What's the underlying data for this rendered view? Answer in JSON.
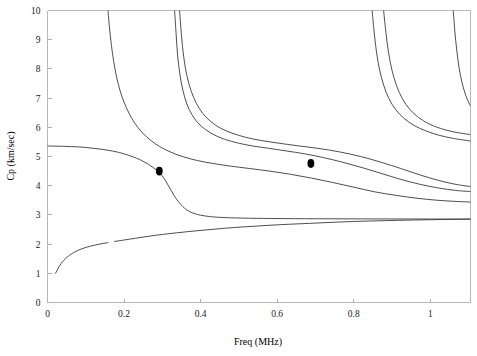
{
  "chart_data": {
    "type": "line",
    "title": "",
    "xlabel": "Freq (MHz)",
    "ylabel": "Cp (km/sec)",
    "xlim": [
      0,
      1.105
    ],
    "ylim": [
      0,
      10
    ],
    "grid": false,
    "legend": "none",
    "xticks": [
      0,
      0.2,
      0.4,
      0.6,
      0.8,
      1
    ],
    "xtick_labels": [
      "0",
      "0.2",
      "0.4",
      "0.6",
      "0.8",
      "1"
    ],
    "yticks": [
      0,
      1,
      2,
      3,
      4,
      5,
      6,
      7,
      8,
      9,
      10
    ],
    "ytick_labels": [
      "0",
      "1",
      "2",
      "3",
      "4",
      "5",
      "6",
      "7",
      "8",
      "9",
      "10"
    ],
    "series": [
      {
        "name": "mode-0-fundamental",
        "points": [
          [
            0.0,
            5.36
          ],
          [
            0.02,
            5.355
          ],
          [
            0.04,
            5.35
          ],
          [
            0.06,
            5.34
          ],
          [
            0.08,
            5.33
          ],
          [
            0.1,
            5.31
          ],
          [
            0.12,
            5.28
          ],
          [
            0.14,
            5.25
          ],
          [
            0.16,
            5.21
          ],
          [
            0.18,
            5.16
          ],
          [
            0.195,
            5.11
          ],
          [
            0.21,
            5.05
          ],
          [
            0.225,
            4.98
          ],
          [
            0.24,
            4.9
          ],
          [
            0.252,
            4.82
          ],
          [
            0.264,
            4.73
          ],
          [
            0.275,
            4.63
          ],
          [
            0.285,
            4.53
          ],
          [
            0.292,
            4.45
          ],
          [
            0.3,
            4.33
          ],
          [
            0.308,
            4.18
          ],
          [
            0.315,
            4.02
          ],
          [
            0.322,
            3.86
          ],
          [
            0.33,
            3.68
          ],
          [
            0.338,
            3.52
          ],
          [
            0.348,
            3.36
          ],
          [
            0.358,
            3.23
          ],
          [
            0.37,
            3.12
          ],
          [
            0.385,
            3.04
          ],
          [
            0.4,
            2.99
          ],
          [
            0.42,
            2.95
          ],
          [
            0.445,
            2.92
          ],
          [
            0.48,
            2.9
          ],
          [
            0.53,
            2.885
          ],
          [
            0.6,
            2.875
          ],
          [
            0.7,
            2.868
          ],
          [
            0.8,
            2.864
          ],
          [
            0.9,
            2.861
          ],
          [
            1.0,
            2.859
          ],
          [
            1.105,
            2.857
          ]
        ]
      },
      {
        "name": "mode-lowest-rising",
        "points": [
          [
            0.021,
            1.0
          ],
          [
            0.025,
            1.1
          ],
          [
            0.03,
            1.22
          ],
          [
            0.036,
            1.34
          ],
          [
            0.043,
            1.45
          ],
          [
            0.052,
            1.56
          ],
          [
            0.062,
            1.66
          ],
          [
            0.074,
            1.75
          ],
          [
            0.088,
            1.83
          ],
          [
            0.104,
            1.9
          ],
          [
            0.122,
            1.96
          ],
          [
            0.14,
            2.01
          ],
          [
            0.158,
            2.05
          ]
        ]
      },
      {
        "name": "mode-lowest-rising-continued",
        "points": [
          [
            0.175,
            2.09
          ],
          [
            0.2,
            2.14
          ],
          [
            0.23,
            2.2
          ],
          [
            0.265,
            2.27
          ],
          [
            0.3,
            2.33
          ],
          [
            0.34,
            2.39
          ],
          [
            0.385,
            2.45
          ],
          [
            0.435,
            2.51
          ],
          [
            0.49,
            2.57
          ],
          [
            0.55,
            2.62
          ],
          [
            0.615,
            2.67
          ],
          [
            0.685,
            2.71
          ],
          [
            0.76,
            2.755
          ],
          [
            0.84,
            2.79
          ],
          [
            0.92,
            2.815
          ],
          [
            1.0,
            2.835
          ],
          [
            1.105,
            2.855
          ]
        ]
      },
      {
        "name": "mode-1",
        "points": [
          [
            0.158,
            10.0
          ],
          [
            0.162,
            9.4
          ],
          [
            0.167,
            8.8
          ],
          [
            0.173,
            8.25
          ],
          [
            0.18,
            7.75
          ],
          [
            0.189,
            7.28
          ],
          [
            0.2,
            6.86
          ],
          [
            0.213,
            6.48
          ],
          [
            0.228,
            6.14
          ],
          [
            0.246,
            5.84
          ],
          [
            0.268,
            5.57
          ],
          [
            0.293,
            5.34
          ],
          [
            0.322,
            5.15
          ],
          [
            0.355,
            4.99
          ],
          [
            0.392,
            4.86
          ],
          [
            0.433,
            4.76
          ],
          [
            0.478,
            4.67
          ],
          [
            0.527,
            4.59
          ],
          [
            0.58,
            4.5
          ],
          [
            0.635,
            4.39
          ],
          [
            0.69,
            4.26
          ],
          [
            0.745,
            4.11
          ],
          [
            0.8,
            3.95
          ],
          [
            0.855,
            3.79
          ],
          [
            0.91,
            3.67
          ],
          [
            0.965,
            3.57
          ],
          [
            1.02,
            3.5
          ],
          [
            1.07,
            3.46
          ],
          [
            1.105,
            3.44
          ]
        ]
      },
      {
        "name": "mode-2",
        "points": [
          [
            0.332,
            10.0
          ],
          [
            0.336,
            9.2
          ],
          [
            0.34,
            8.45
          ],
          [
            0.346,
            7.8
          ],
          [
            0.354,
            7.25
          ],
          [
            0.364,
            6.8
          ],
          [
            0.377,
            6.44
          ],
          [
            0.393,
            6.15
          ],
          [
            0.413,
            5.92
          ],
          [
            0.437,
            5.73
          ],
          [
            0.465,
            5.58
          ],
          [
            0.498,
            5.46
          ],
          [
            0.536,
            5.36
          ],
          [
            0.578,
            5.28
          ],
          [
            0.624,
            5.19
          ],
          [
            0.672,
            5.09
          ],
          [
            0.722,
            4.96
          ],
          [
            0.772,
            4.8
          ],
          [
            0.822,
            4.62
          ],
          [
            0.872,
            4.42
          ],
          [
            0.922,
            4.22
          ],
          [
            0.972,
            4.05
          ],
          [
            1.022,
            3.92
          ],
          [
            1.065,
            3.84
          ],
          [
            1.105,
            3.8
          ]
        ]
      },
      {
        "name": "mode-3",
        "points": [
          [
            0.345,
            10.0
          ],
          [
            0.35,
            9.15
          ],
          [
            0.356,
            8.4
          ],
          [
            0.364,
            7.78
          ],
          [
            0.375,
            7.25
          ],
          [
            0.389,
            6.82
          ],
          [
            0.406,
            6.47
          ],
          [
            0.427,
            6.19
          ],
          [
            0.452,
            5.97
          ],
          [
            0.482,
            5.8
          ],
          [
            0.517,
            5.66
          ],
          [
            0.557,
            5.55
          ],
          [
            0.602,
            5.46
          ],
          [
            0.652,
            5.37
          ],
          [
            0.706,
            5.28
          ],
          [
            0.762,
            5.16
          ],
          [
            0.818,
            5.0
          ],
          [
            0.872,
            4.8
          ],
          [
            0.925,
            4.58
          ],
          [
            0.975,
            4.36
          ],
          [
            1.022,
            4.18
          ],
          [
            1.065,
            4.05
          ],
          [
            1.105,
            3.97
          ]
        ]
      },
      {
        "name": "mode-4",
        "points": [
          [
            0.848,
            10.0
          ],
          [
            0.853,
            9.3
          ],
          [
            0.859,
            8.62
          ],
          [
            0.867,
            8.0
          ],
          [
            0.878,
            7.45
          ],
          [
            0.892,
            6.98
          ],
          [
            0.91,
            6.6
          ],
          [
            0.932,
            6.3
          ],
          [
            0.958,
            6.06
          ],
          [
            0.988,
            5.88
          ],
          [
            1.022,
            5.73
          ],
          [
            1.06,
            5.62
          ],
          [
            1.105,
            5.53
          ]
        ]
      },
      {
        "name": "mode-5",
        "points": [
          [
            0.878,
            10.0
          ],
          [
            0.884,
            9.25
          ],
          [
            0.891,
            8.55
          ],
          [
            0.9,
            7.95
          ],
          [
            0.912,
            7.42
          ],
          [
            0.927,
            6.98
          ],
          [
            0.946,
            6.62
          ],
          [
            0.969,
            6.34
          ],
          [
            0.996,
            6.12
          ],
          [
            1.027,
            5.96
          ],
          [
            1.062,
            5.84
          ],
          [
            1.105,
            5.75
          ]
        ]
      },
      {
        "name": "mode-6",
        "points": [
          [
            1.06,
            10.0
          ],
          [
            1.064,
            9.3
          ],
          [
            1.069,
            8.65
          ],
          [
            1.075,
            8.05
          ],
          [
            1.083,
            7.52
          ],
          [
            1.093,
            7.08
          ],
          [
            1.105,
            6.72
          ]
        ]
      }
    ],
    "markers": [
      {
        "name": "data-point-1",
        "x": 0.292,
        "y": 4.5
      },
      {
        "name": "data-point-2",
        "x": 0.688,
        "y": 4.76
      }
    ]
  }
}
